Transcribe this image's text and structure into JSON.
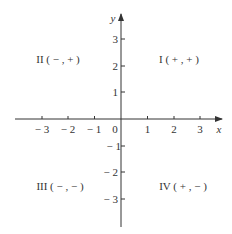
{
  "diagram": {
    "axis_color": "#333333",
    "text_color": "#333333",
    "background": "#ffffff",
    "x_axis": {
      "label": "x",
      "ticks": [
        {
          "value": -3,
          "label": "− 3"
        },
        {
          "value": -2,
          "label": "− 2"
        },
        {
          "value": -1,
          "label": "− 1"
        },
        {
          "value": 1,
          "label": "1"
        },
        {
          "value": 2,
          "label": "2"
        },
        {
          "value": 3,
          "label": "3"
        }
      ]
    },
    "y_axis": {
      "label": "y",
      "ticks": [
        {
          "value": 3,
          "label": "3"
        },
        {
          "value": 2,
          "label": "2"
        },
        {
          "value": 1,
          "label": "1"
        },
        {
          "value": -1,
          "label": "− 1"
        },
        {
          "value": -2,
          "label": "− 2"
        },
        {
          "value": -3,
          "label": "− 3"
        }
      ]
    },
    "origin_label": "0",
    "quadrants": {
      "I": "I ( + ,  + )",
      "II": "II ( − ,  + )",
      "III": "III ( − ,  − )",
      "IV": "IV ( + ,  − )"
    }
  }
}
